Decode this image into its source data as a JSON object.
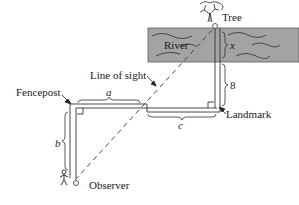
{
  "diagram": {
    "type": "geometry word problem figure",
    "labels": {
      "tree": "Tree",
      "river": "River",
      "fencepost": "Fencepost",
      "line_of_sight": "Line of sight",
      "landmark": "Landmark",
      "observer": "Observer"
    },
    "variables": {
      "a": "a",
      "b": "b",
      "c": "c",
      "x": "x",
      "eight": "8"
    },
    "colors": {
      "river_fill": "#a3a3a3",
      "river_border": "#5a5a5a",
      "line": "#333333",
      "text": "#1a1a1a"
    }
  }
}
